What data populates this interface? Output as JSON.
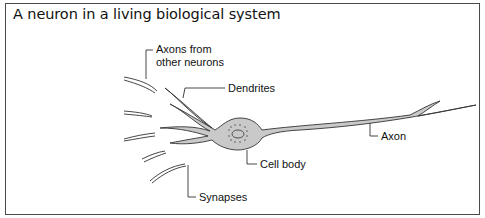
{
  "title": "A neuron in a living biological system",
  "labels": {
    "axons_from_line1": "Axons from",
    "axons_from_line2": "other neurons",
    "dendrites": "Dendrites",
    "cell_body": "Cell body",
    "axon": "Axon",
    "synapses": "Synapses"
  },
  "colors": {
    "cell_fill": "#c9c9c9",
    "stroke": "#333333",
    "border": "#4a4a4a"
  }
}
